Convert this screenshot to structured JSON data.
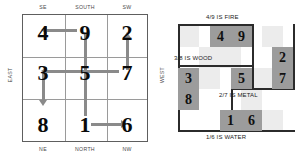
{
  "diagram": {
    "colors": {
      "tile_dark": "#9c9c9c",
      "tile_light": "#ececec",
      "arrow": "#8a8a8a",
      "grid_border": "#5e5e5e",
      "grid_inner": "#9a9a9a",
      "rule": "#2b2b2b",
      "text": "#0a0a0a",
      "background": "#ffffff"
    }
  },
  "loshu": {
    "compass": {
      "top_left": "SE",
      "top_center": "SOUTH",
      "top_right": "SW",
      "left": "EAST",
      "right": "WEST",
      "bottom_left": "NE",
      "bottom_center": "NORTH",
      "bottom_right": "NW"
    },
    "rows": [
      {
        "cells": [
          "4",
          "9",
          "2"
        ]
      },
      {
        "cells": [
          "3",
          "5",
          "7"
        ]
      },
      {
        "cells": [
          "8",
          "1",
          "6"
        ]
      }
    ],
    "arrows": [
      {
        "name": "nine-to-four",
        "from": "9",
        "to": "4",
        "direction": "left"
      },
      {
        "name": "nine-to-five",
        "from": "9",
        "to": "5",
        "direction": "down"
      },
      {
        "name": "seven-to-three",
        "from": "7",
        "to": "3",
        "direction": "left"
      },
      {
        "name": "seven-to-two",
        "from": "7",
        "to": "2",
        "direction": "up"
      },
      {
        "name": "three-to-eight",
        "from": "3",
        "to": "8",
        "direction": "down"
      },
      {
        "name": "five-to-one",
        "from": "5",
        "to": "1",
        "direction": "down"
      },
      {
        "name": "one-to-six",
        "from": "1",
        "to": "6",
        "direction": "right"
      }
    ]
  },
  "elements": {
    "pairs": [
      {
        "name": "fire",
        "label": "4/9 IS FIRE",
        "tiles": [
          {
            "value": "4",
            "shade": "dark"
          },
          {
            "value": "9",
            "shade": "dark"
          }
        ]
      },
      {
        "name": "wood",
        "label": "3/8 IS WOOD",
        "tiles": [
          {
            "value": "3",
            "shade": "dark"
          },
          {
            "value": "8",
            "shade": "dark"
          }
        ]
      },
      {
        "name": "metal",
        "label": "2/7 IS METAL",
        "tiles": [
          {
            "value": "2",
            "shade": "dark"
          },
          {
            "value": "7",
            "shade": "dark"
          }
        ]
      },
      {
        "name": "water",
        "label": "1/6 IS WATER",
        "tiles": [
          {
            "value": "1",
            "shade": "dark"
          },
          {
            "value": "6",
            "shade": "dark"
          }
        ]
      },
      {
        "name": "earth",
        "label": "",
        "tiles": [
          {
            "value": "5",
            "shade": "dark"
          }
        ]
      }
    ]
  }
}
